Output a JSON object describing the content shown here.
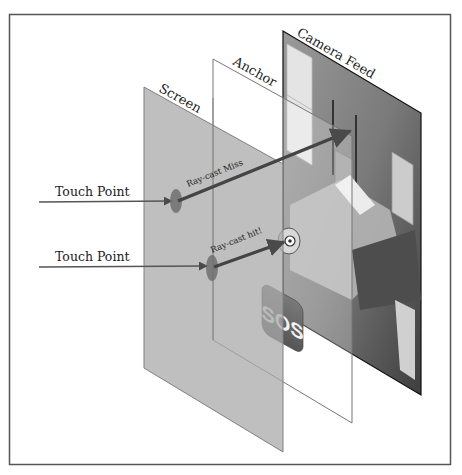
{
  "diagram": {
    "title_fragment": "",
    "planes": {
      "screen": {
        "label": "Screen",
        "fill": "#a9a9a9",
        "opacity": 0.75
      },
      "anchor": {
        "label": "Anchor",
        "fill": "#ffffff",
        "opacity": 0.15
      },
      "camera": {
        "label": "Camera Feed",
        "fill": "#6d6d6d"
      }
    },
    "touch_points": [
      {
        "label": "Touch Point",
        "ray_label": "Ray-cast Miss"
      },
      {
        "label": "Touch Point",
        "ray_label": "Ray-cast hit!"
      }
    ],
    "sos_icon": {
      "text": "SOS",
      "color": "#6a6a6a"
    },
    "colors": {
      "frame": "#555555",
      "arrow": "#4a4a4a",
      "touch_marker": "#6e6e6e",
      "camera_edge": "#111111"
    }
  }
}
